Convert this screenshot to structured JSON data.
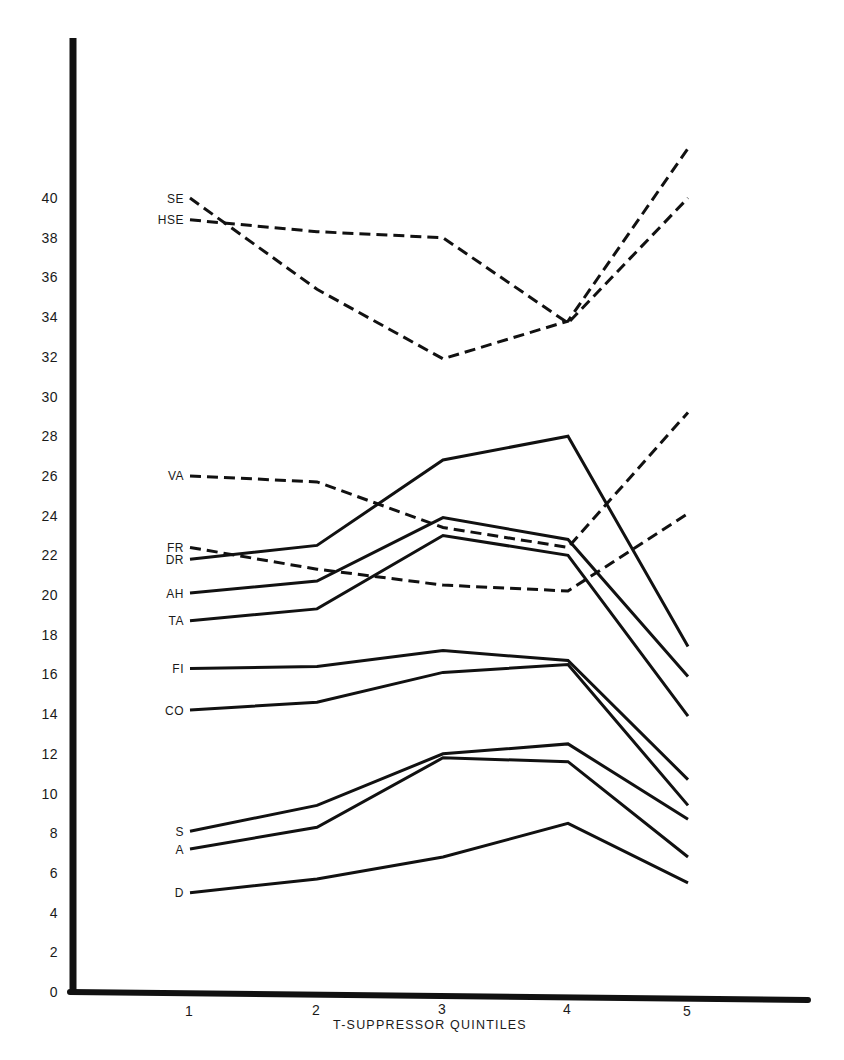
{
  "chart_data": {
    "type": "line",
    "title": "",
    "xlabel": "T-SUPPRESSOR QUINTILES",
    "ylabel": "",
    "x": [
      1,
      2,
      3,
      4,
      5
    ],
    "x_tick_labels": [
      "1",
      "2",
      "3",
      "4",
      "5"
    ],
    "y_tick_labels": [
      "0",
      "2",
      "4",
      "6",
      "8",
      "10",
      "12",
      "14",
      "16",
      "18",
      "20",
      "22",
      "24",
      "26",
      "28",
      "30",
      "32",
      "34",
      "36",
      "38",
      "40"
    ],
    "ylim": [
      0,
      48
    ],
    "grid": false,
    "legend": "inline labels at left of each series",
    "series": [
      {
        "name": "SE",
        "style": "dashed",
        "values": [
          40.0,
          35.4,
          31.9,
          33.8,
          42.5
        ]
      },
      {
        "name": "HSE",
        "style": "dashed",
        "values": [
          38.9,
          38.3,
          38.0,
          33.7,
          40.0
        ]
      },
      {
        "name": "VA",
        "style": "dashed",
        "values": [
          26.0,
          25.7,
          23.4,
          22.4,
          29.2
        ]
      },
      {
        "name": "FR",
        "style": "dashed",
        "values": [
          22.4,
          21.3,
          20.5,
          20.2,
          24.1
        ]
      },
      {
        "name": "DR",
        "style": "solid",
        "values": [
          21.8,
          22.5,
          26.8,
          28.0,
          17.4
        ]
      },
      {
        "name": "AH",
        "style": "solid",
        "values": [
          20.1,
          20.7,
          23.9,
          22.8,
          15.9
        ]
      },
      {
        "name": "TA",
        "style": "solid",
        "values": [
          18.7,
          19.3,
          23.0,
          22.0,
          13.9
        ]
      },
      {
        "name": "FI",
        "style": "solid",
        "values": [
          16.3,
          16.4,
          17.2,
          16.7,
          10.7
        ]
      },
      {
        "name": "CO",
        "style": "solid",
        "values": [
          14.2,
          14.6,
          16.1,
          16.5,
          9.4
        ]
      },
      {
        "name": "S",
        "style": "solid",
        "values": [
          8.1,
          9.4,
          12.0,
          12.5,
          8.7
        ]
      },
      {
        "name": "A",
        "style": "solid",
        "values": [
          7.2,
          8.3,
          11.8,
          11.6,
          6.8
        ]
      },
      {
        "name": "D",
        "style": "solid",
        "values": [
          5.0,
          5.7,
          6.8,
          8.5,
          5.5
        ]
      }
    ]
  },
  "axes": {
    "x_title": "T-SUPPRESSOR QUINTILES",
    "line_color": "#111111",
    "background": "#ffffff"
  }
}
